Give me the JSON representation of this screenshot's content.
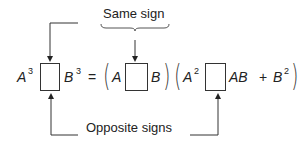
{
  "labels": {
    "top": "Same sign",
    "bottom": "Opposite signs"
  },
  "equation": {
    "lhs_a": "A",
    "lhs_a_exp": "3",
    "lhs_b": "B",
    "lhs_b_exp": "3",
    "equals": "=",
    "f1_a": "A",
    "f1_b": "B",
    "f2_a": "A",
    "f2_a_exp": "2",
    "f2_ab": "AB",
    "plus": "+",
    "f2_b": "B",
    "f2_b_exp": "2",
    "open_paren": "(",
    "close_paren": ")"
  }
}
